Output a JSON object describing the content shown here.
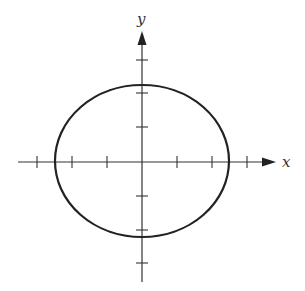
{
  "diagram": {
    "type": "ellipse-on-axes",
    "axes": {
      "x_label": "x",
      "y_label": "y"
    },
    "origin_px": [
      142,
      162
    ],
    "tick_spacing_px": 35,
    "x_ticks": [
      -3,
      -2,
      -1,
      1,
      2,
      3
    ],
    "y_ticks": [
      -3,
      -2,
      -1,
      1,
      2,
      3
    ],
    "ellipse": {
      "center": [
        0,
        0
      ],
      "semi_axis_x": 2.5,
      "semi_axis_y": 2.2
    },
    "stroke_color": "#222222"
  }
}
